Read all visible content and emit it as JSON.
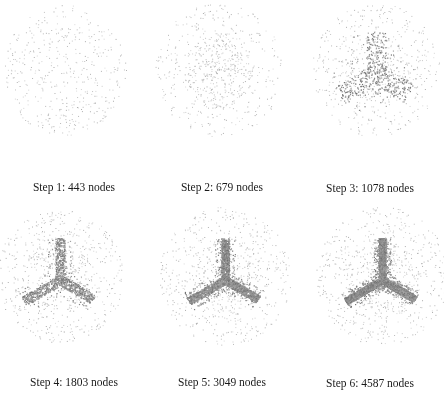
{
  "figure": {
    "panels": [
      {
        "step": 1,
        "nodes": 443,
        "caption": "Step 1: 443 nodes",
        "x": 0,
        "y": 0,
        "cx": 64,
        "cy": 70,
        "r": 62,
        "arm_density": 0,
        "arm_width": 0,
        "inner": 0.0,
        "caption_y": 181
      },
      {
        "step": 2,
        "nodes": 679,
        "caption": "Step 2: 679 nodes",
        "x": 148,
        "y": 0,
        "cx": 71,
        "cy": 70,
        "r": 64,
        "arm_density": 0,
        "arm_width": 0,
        "inner": 0.45,
        "caption_y": 181
      },
      {
        "step": 3,
        "nodes": 1078,
        "caption": "Step 3: 1078 nodes",
        "x": 296,
        "y": 0,
        "cx": 80,
        "cy": 70,
        "r": 64,
        "arm_density": 500,
        "arm_width": 10,
        "inner": 0.2,
        "caption_y": 182
      },
      {
        "step": 4,
        "nodes": 1803,
        "caption": "Step 4: 1803 nodes",
        "x": 0,
        "y": 198,
        "cx": 60,
        "cy": 78,
        "r": 64,
        "arm_density": 1100,
        "arm_width": 5,
        "inner": 0.25,
        "caption_y": 178
      },
      {
        "step": 5,
        "nodes": 3049,
        "caption": "Step 5: 3049 nodes",
        "x": 148,
        "y": 198,
        "cx": 77,
        "cy": 78,
        "r": 66,
        "arm_density": 2300,
        "arm_width": 4,
        "inner": 0.25,
        "caption_y": 178
      },
      {
        "step": 6,
        "nodes": 4587,
        "caption": "Step 6: 4587 nodes",
        "x": 296,
        "y": 198,
        "cx": 86,
        "cy": 78,
        "r": 66,
        "arm_density": 3800,
        "arm_width": 3.5,
        "inner": 0.25,
        "caption_y": 179
      }
    ],
    "colors": {
      "background": "#ffffff",
      "node": "#8a8a8a",
      "caption": "#1a1a1a"
    },
    "arm_length": {
      "up": 42,
      "left": 42,
      "right": 38
    }
  }
}
